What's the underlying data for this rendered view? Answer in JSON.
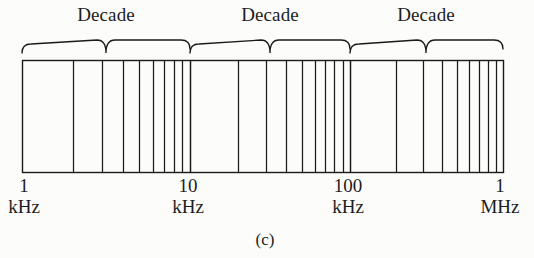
{
  "figure": {
    "caption": "(c)",
    "caption_x": 265,
    "caption_y": 230,
    "background_color": "#fcfcfb",
    "line_color": "#1a1a1a"
  },
  "axis": {
    "type": "logarithmic-frequency-scale",
    "box": {
      "x": 22,
      "y": 60,
      "width": 481,
      "height": 112
    },
    "decade_boundaries_px": [
      22,
      190,
      350,
      503
    ],
    "minor_multipliers": [
      2,
      3,
      4,
      5,
      6,
      7,
      8,
      9
    ],
    "tick_labels": [
      {
        "value": "1",
        "unit": "kHz",
        "x": 22
      },
      {
        "value": "10",
        "unit": "kHz",
        "x": 188
      },
      {
        "value": "100",
        "unit": "kHz",
        "x": 348
      },
      {
        "value": "1",
        "unit": "MHz",
        "x": 502
      }
    ],
    "tick_label_y": 176
  },
  "braces": {
    "label": "Decade",
    "label_y": 4,
    "items": [
      {
        "label": "Decade",
        "start_px": 22,
        "end_px": 190,
        "center_px": 106
      },
      {
        "label": "Decade",
        "start_px": 190,
        "end_px": 350,
        "center_px": 270
      },
      {
        "label": "Decade",
        "start_px": 350,
        "end_px": 503,
        "center_px": 426
      }
    ]
  },
  "chart_data": {
    "type": "line",
    "title": "",
    "subtitle": "(c)",
    "xlabel": "Frequency",
    "ylabel": "",
    "xscale": "log",
    "xlim": [
      1000,
      1000000
    ],
    "grid": true,
    "legend": false,
    "annotations": [
      "Decade",
      "Decade",
      "Decade"
    ],
    "x_tick_labels": [
      "1 kHz",
      "10 kHz",
      "100 kHz",
      "1 MHz"
    ],
    "x_major_ticks": [
      1000,
      10000,
      100000,
      1000000
    ],
    "x_minor_ticks": [
      2000,
      3000,
      4000,
      5000,
      6000,
      7000,
      8000,
      9000,
      20000,
      30000,
      40000,
      50000,
      60000,
      70000,
      80000,
      90000,
      200000,
      300000,
      400000,
      500000,
      600000,
      700000,
      800000,
      900000
    ],
    "decades": [
      {
        "from": 1000,
        "to": 10000,
        "label": "Decade"
      },
      {
        "from": 10000,
        "to": 100000,
        "label": "Decade"
      },
      {
        "from": 100000,
        "to": 1000000,
        "label": "Decade"
      }
    ]
  }
}
